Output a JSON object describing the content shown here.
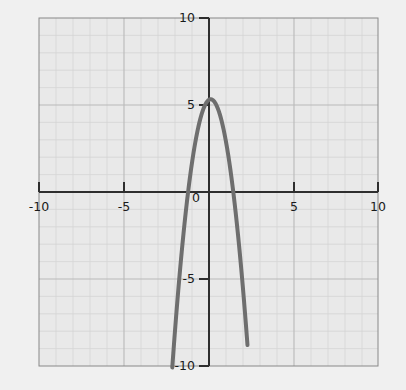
{
  "chart_data": {
    "type": "line",
    "title": "",
    "subtitle": "",
    "xlabel": "",
    "ylabel": "",
    "xlim": [
      -10,
      10
    ],
    "ylim": [
      -10,
      10
    ],
    "grid": true,
    "grid_minor_step": 1,
    "grid_major_step": 5,
    "legend": null,
    "axes_style": "cartesian-cross",
    "x_tick_labels": [
      "-10",
      "-5",
      "0",
      "5",
      "10"
    ],
    "x_tick_values": [
      -10,
      -5,
      0,
      5,
      10
    ],
    "y_tick_labels": [
      "10",
      "5",
      "-5",
      "-10"
    ],
    "y_tick_values": [
      10,
      5,
      -5,
      -10
    ],
    "origin_label": "0",
    "series": [
      {
        "name": "parabola",
        "equation": "y = -3x^2 + 0.6x + 5.3",
        "color": "#6e6e6e",
        "linewidth": 4,
        "vertex": [
          0.1,
          5.33
        ],
        "x_intercepts": [
          -1.23,
          1.43
        ],
        "y_intercept": 5.3,
        "x": [
          -2.27,
          -2.1,
          -1.9,
          -1.7,
          -1.5,
          -1.3,
          -1.1,
          -0.9,
          -0.7,
          -0.5,
          -0.3,
          -0.1,
          0.1,
          0.3,
          0.5,
          0.7,
          0.9,
          1.1,
          1.3,
          1.5,
          1.7,
          1.9,
          2.1,
          2.27
        ],
        "y": [
          -10.0,
          -9.19,
          -7.66,
          -6.39,
          -6.28,
          -3.55,
          -2.99,
          -1.67,
          -0.6,
          0.25,
          4.85,
          5.21,
          5.33,
          5.21,
          4.85,
          4.25,
          3.41,
          2.33,
          1.01,
          -0.55,
          -2.35,
          -4.39,
          -6.67,
          -10.0
        ]
      }
    ]
  },
  "figure": {
    "background_color": "#f0f0f0",
    "plot_background_color": "#e8e8e8",
    "grid_minor_color": "#d0d0d0",
    "grid_major_color": "#b8b8b8",
    "axis_color": "#333333",
    "border_color": "#808080",
    "tick_label_color": "#1a1a1a"
  }
}
